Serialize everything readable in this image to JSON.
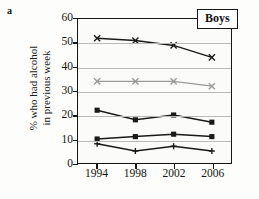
{
  "panel": {
    "letter": "a",
    "legend_label": "Boys"
  },
  "axes": {
    "ylabel_line1": "% who had alcohol",
    "ylabel_line2": "in previous week",
    "yticks": [
      "0",
      "10",
      "20",
      "30",
      "40",
      "50",
      "60"
    ],
    "xticks": [
      "1994",
      "1998",
      "2002",
      "2006"
    ]
  },
  "colors": {
    "series_black": "#1a1a1a",
    "series_gray": "#9a9a9a",
    "grid": "#b9b9b9",
    "frame": "#161616",
    "background": "#fbfbf9"
  },
  "chart_data": {
    "type": "line",
    "title": "Boys",
    "xlabel": "",
    "ylabel": "% who had alcohol in previous week",
    "categories": [
      "1994",
      "1998",
      "2002",
      "2006"
    ],
    "x": [
      1994,
      1998,
      2002,
      2006
    ],
    "xlim": [
      1992,
      2008
    ],
    "ylim": [
      0,
      60
    ],
    "ytick_step": 10,
    "grid": true,
    "legend_position": "top-right",
    "series": [
      {
        "name": "series-1",
        "marker": "cross",
        "color": "#1a1a1a",
        "values": [
          52,
          51,
          49,
          44
        ]
      },
      {
        "name": "series-2",
        "marker": "cross",
        "color": "#9a9a9a",
        "values": [
          34,
          34,
          34,
          32
        ]
      },
      {
        "name": "series-3",
        "marker": "square",
        "color": "#1a1a1a",
        "values": [
          22,
          18,
          20,
          17
        ]
      },
      {
        "name": "series-4",
        "marker": "square",
        "color": "#1a1a1a",
        "values": [
          10,
          11,
          12,
          11
        ]
      },
      {
        "name": "series-5",
        "marker": "plus",
        "color": "#1a1a1a",
        "values": [
          8,
          5,
          7,
          5
        ]
      }
    ]
  }
}
